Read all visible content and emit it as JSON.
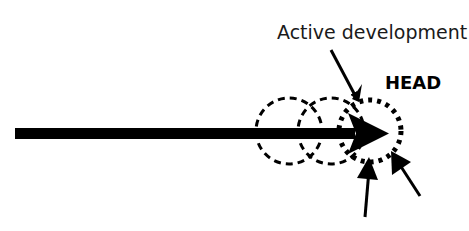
{
  "diagram": {
    "labels": {
      "active_development": "Active development",
      "head": "HEAD"
    },
    "colors": {
      "ink": "#000000",
      "background": "#ffffff"
    },
    "elements": {
      "timeline_arrow": "main development line",
      "past_positions": [
        "previous position 1",
        "previous position 2"
      ],
      "current_position": "HEAD position",
      "pointer_arrows": 3
    }
  }
}
